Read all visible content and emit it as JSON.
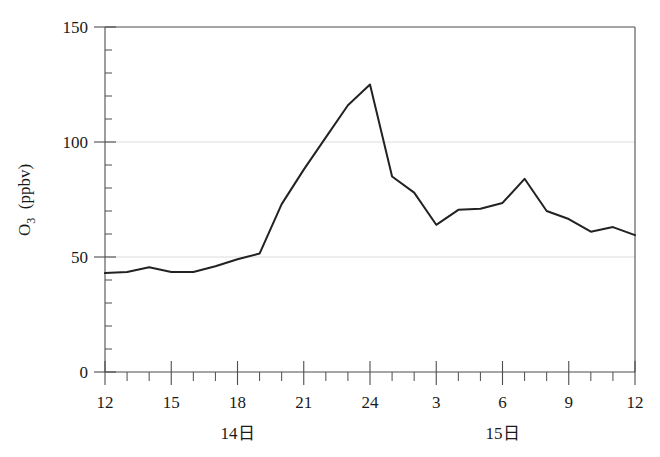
{
  "chart_data": {
    "type": "line",
    "title": "",
    "subtitle": "",
    "xlabel": "",
    "ylabel": "O3 (ppbv)",
    "ylabel_main": "O",
    "ylabel_sub": "3",
    "ylabel_unit": "(ppbv)",
    "ylim": [
      0,
      150
    ],
    "xlim": [
      12,
      36
    ],
    "grid": "horizontal-dotted-at-50-100",
    "legend": "none",
    "y_ticks_major": [
      0,
      50,
      100,
      150
    ],
    "y_tick_labels": [
      "0",
      "50",
      "100",
      "150"
    ],
    "y_tick_minor_step": 10,
    "x_ticks_major": [
      12,
      15,
      18,
      21,
      24,
      27,
      30,
      33,
      36
    ],
    "x_tick_labels": [
      "12",
      "15",
      "18",
      "21",
      "24",
      "3",
      "6",
      "9",
      "12"
    ],
    "x_tick_minor_step": 1,
    "day_labels": [
      {
        "text": "14日",
        "x": 18
      },
      {
        "text": "15日",
        "x": 30
      }
    ],
    "series": [
      {
        "name": "O3",
        "color": "#222222",
        "x": [
          12,
          13,
          14,
          15,
          16,
          17,
          18,
          19,
          20,
          21,
          22,
          23,
          24,
          25,
          26,
          27,
          28,
          29,
          30,
          31,
          32,
          33,
          34,
          35,
          36
        ],
        "values": [
          43,
          43.5,
          45.5,
          43.5,
          43.5,
          46,
          49,
          51.5,
          73,
          88,
          102,
          116,
          125,
          85,
          78,
          64,
          70.5,
          71,
          73.5,
          84,
          70,
          66.5,
          61,
          63,
          59.5
        ]
      }
    ]
  },
  "colors": {
    "line": "#222222",
    "axis": "#4d4d4d",
    "grid": "#d8d8d8",
    "background": "#ffffff",
    "text": "#1a1a1a"
  }
}
